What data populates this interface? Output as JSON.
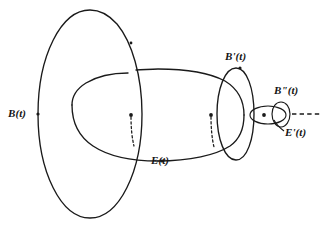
{
  "figure": {
    "background_color": "#ffffff",
    "stroke_color": "#1a1a1a",
    "width": 328,
    "height": 230,
    "labels": {
      "B": "B(t)",
      "E": "E(t)",
      "B_prime": "B'(t)",
      "B_double_prime": "B\"(t)",
      "E_prime": "E'(t)"
    },
    "label_parts": {
      "B": {
        "base": "B",
        "primes": "",
        "arg": "(t)"
      },
      "E": {
        "base": "E",
        "primes": "",
        "arg": "(t)"
      },
      "Bp": {
        "base": "B",
        "primes": "'",
        "arg": "(t)"
      },
      "Bpp": {
        "base": "B",
        "primes": "\"",
        "arg": "(t)"
      },
      "Ep": {
        "base": "E",
        "primes": "'",
        "arg": "(t)"
      }
    },
    "curves": [
      {
        "name": "B-loop",
        "label": "B(t)",
        "role": "outer-vertical-circle",
        "center": [
          90,
          114
        ],
        "rx": 52,
        "ry": 104,
        "style": "solid"
      },
      {
        "name": "E-loop",
        "label": "E(t)",
        "role": "horizontal-circle-linked-through-B",
        "center": [
          158,
          115
        ],
        "rx": 86,
        "ry": 46,
        "style": "solid-with-hidden-segments"
      },
      {
        "name": "B-prime-loop",
        "label": "B'(t)",
        "role": "vertical-circle-linked-through-E",
        "center": [
          235,
          114
        ],
        "rx": 18,
        "ry": 46,
        "style": "solid"
      },
      {
        "name": "E-prime-loop",
        "label": "E'(t)",
        "role": "small-horizontal-circle-linked-through-B-prime",
        "center": [
          268,
          115
        ],
        "rx": 18,
        "ry": 9,
        "style": "solid"
      },
      {
        "name": "B-double-prime-loop",
        "label": "B\"(t)",
        "role": "smallest-vertical-circle",
        "center": [
          281,
          114
        ],
        "rx": 6,
        "ry": 12,
        "style": "solid"
      },
      {
        "name": "continuation-axis",
        "label": "",
        "role": "dashed-continuation-to-right",
        "from": [
          292,
          114
        ],
        "to": [
          322,
          114
        ],
        "style": "dashed"
      }
    ],
    "marked_points": [
      {
        "name": "B-point",
        "label": "B(t)",
        "at": [
          38,
          114
        ]
      },
      {
        "name": "E-point",
        "label": "E(t)",
        "at": [
          162,
          161
        ]
      },
      {
        "name": "link-1",
        "label": "",
        "at": [
          131,
          115
        ]
      },
      {
        "name": "link-2",
        "label": "",
        "at": [
          211,
          115
        ]
      },
      {
        "name": "Bp-point",
        "label": "B'(t)",
        "at": [
          240,
          68
        ]
      },
      {
        "name": "Ep-point",
        "label": "E'(t)",
        "at": [
          264,
          115
        ]
      },
      {
        "name": "top-tick",
        "label": "",
        "at": [
          131,
          43
        ]
      }
    ]
  }
}
